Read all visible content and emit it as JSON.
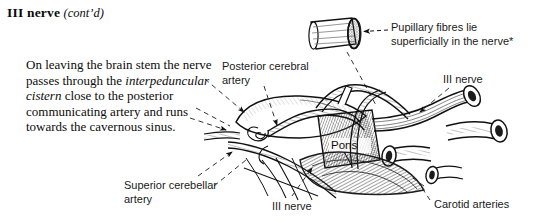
{
  "figure": {
    "heading": {
      "main": "III nerve",
      "continued": "(cont’d)"
    },
    "body_paragraph": {
      "segment_1": "     On leaving the brain stem the nerve passes through the ",
      "segment_italic": "interpeduncular cistern",
      "segment_2": " close to the posterior communicating artery and runs towards the cavernous sinus."
    },
    "labels": {
      "pupillary_fibres": "Pupillary fibres lie\nsuperficially in the nerve*",
      "posterior_cerebral_artery": "Posterior cerebral\nartery",
      "third_nerve_right": "III nerve",
      "third_nerve_bottom": "III nerve",
      "superior_cerebellar_artery": "Superior cerebellar\nartery",
      "carotid_arteries": "Carotid arteries",
      "pons": "Pons"
    },
    "colors": {
      "ink": "#0b0b0b",
      "label_ink": "#1a1a1a",
      "background": "#ffffff",
      "shading_light": "#d8d8d8",
      "shading_mid": "#9a9a9a",
      "shading_dark": "#4a4a4a"
    }
  }
}
